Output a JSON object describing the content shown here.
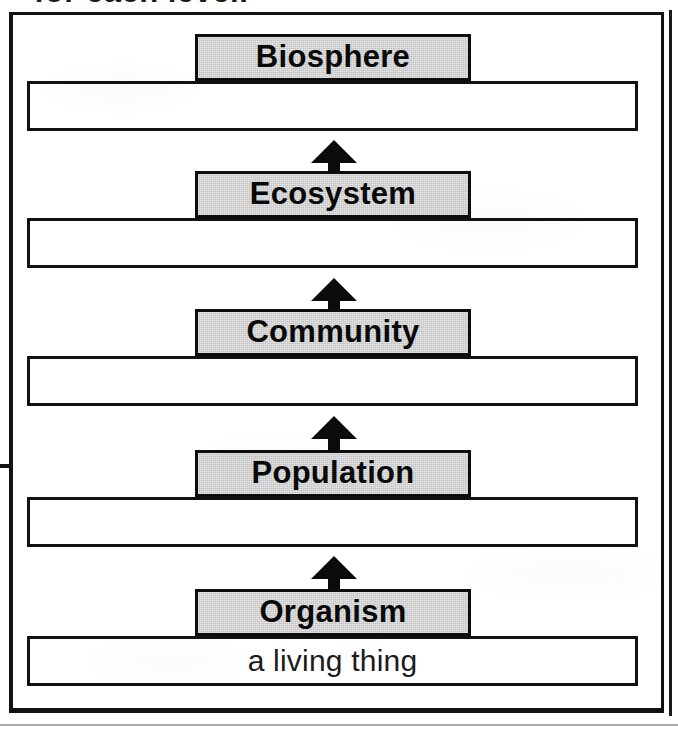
{
  "document": {
    "type": "textbook-figure",
    "clipped_caption": "for each level.",
    "colors": {
      "ink": "#111111",
      "box_fill": "#c4c4c4",
      "page": "#ffffff"
    }
  },
  "diagram": {
    "arrow_direction": "up",
    "arrow_count": 4,
    "levels": [
      {
        "label": "Biosphere",
        "description": "",
        "box_top": 34,
        "bar_top": 81,
        "arrow_top": 140,
        "has_arrow_below": true
      },
      {
        "label": "Ecosystem",
        "description": "",
        "box_top": 171,
        "bar_top": 218,
        "arrow_top": 278,
        "has_arrow_below": true
      },
      {
        "label": "Community",
        "description": "",
        "box_top": 309,
        "bar_top": 356,
        "arrow_top": 416,
        "has_arrow_below": true
      },
      {
        "label": "Population",
        "description": "",
        "box_top": 450,
        "bar_top": 497,
        "arrow_top": 556,
        "has_arrow_below": true
      },
      {
        "label": "Organism",
        "description": "a living thing",
        "box_top": 589,
        "bar_top": 636,
        "arrow_top": null,
        "has_arrow_below": false
      }
    ]
  }
}
